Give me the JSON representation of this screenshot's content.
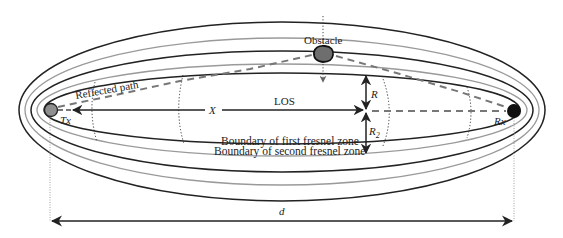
{
  "diagram": {
    "type": "fresnel-zone-diagram",
    "labels": {
      "obstacle": "Obstacle",
      "reflected_path": "Reflected path",
      "los": "LOS",
      "x": "X",
      "tx": "Tx",
      "rx": "Rx",
      "r": "R",
      "r2_base": "R",
      "r2_sub": "2",
      "boundary_first": "Boundary of first fresnel zone",
      "boundary_second": "Boundary of second fresnel zone",
      "d": "d"
    },
    "colors": {
      "black_line": "#222222",
      "gray_line": "#9a9a9a",
      "dashed_path": "#777777",
      "tx_fill": "#8f8f8f",
      "rx_fill": "#111111",
      "obstacle_fill": "#6e6e6e"
    },
    "ellipses": [
      {
        "name": "outer-ellipse-5",
        "stroke": "black",
        "rx": 263,
        "ry_top": 88,
        "ry_bottom": 91
      },
      {
        "name": "ellipse-4",
        "stroke": "gray",
        "rx": 257,
        "ry_top": 72,
        "ry_bottom": 75
      },
      {
        "name": "ellipse-3",
        "stroke": "black",
        "rx": 251,
        "ry_top": 59,
        "ry_bottom": 62
      },
      {
        "name": "ellipse-2",
        "stroke": "gray",
        "rx": 245,
        "ry_top": 46,
        "ry_bottom": 46
      },
      {
        "name": "first-fresnel-ellipse",
        "stroke": "black",
        "rx": 238,
        "ry_top": 37,
        "ry_bottom": 34
      }
    ]
  }
}
